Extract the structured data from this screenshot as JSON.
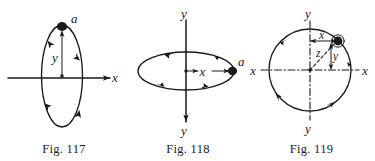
{
  "plate": {
    "background_color": "#ffffff",
    "ink_color": "#1a1a1a",
    "figure_count": 3
  },
  "figures": [
    {
      "id": "fig-117",
      "caption": "Fig. 117",
      "description": "Narrow vertical ellipse orbit crossed by a horizontal x-axis; particle a at the top.",
      "labels": {
        "particle": "a",
        "vertical_coordinate": "y",
        "horizontal_axis": "x"
      },
      "axis_labels": [
        "x"
      ],
      "orbit_shape": "vertical-ellipse",
      "arrow_count": 4
    },
    {
      "id": "fig-118",
      "caption": "Fig. 118",
      "description": "Flat horizontal ellipse orbit in perspective with a vertical y-axis; particle a at the right end, x measured from centre.",
      "labels": {
        "particle": "a",
        "horizontal_coordinate": "x",
        "axis_top": "y",
        "axis_bottom": "y"
      },
      "axis_labels": [
        "y",
        "y"
      ],
      "orbit_shape": "horizontal-ellipse",
      "arrow_count": 4
    },
    {
      "id": "fig-119",
      "caption": "Fig. 119",
      "description": "Circular orbit with dash-dot x and y axes through the centre; particle at upper right with coordinates x, y and radius z.",
      "labels": {
        "axis_left": "x",
        "axis_right": "x",
        "axis_top": "y",
        "axis_bottom": "y",
        "abscissa": "x",
        "ordinate": "y",
        "radius": "z"
      },
      "axis_labels": [
        "x",
        "x",
        "y",
        "y"
      ],
      "orbit_shape": "circle",
      "arrow_count": 4
    }
  ]
}
